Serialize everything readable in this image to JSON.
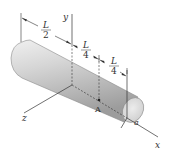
{
  "figure": {
    "type": "3D engineering diagram",
    "axes": {
      "x_label": "x",
      "y_label": "y",
      "z_label": "z"
    },
    "dimensions": [
      {
        "numerator": "L",
        "denominator": "2"
      },
      {
        "numerator": "L",
        "denominator": "4"
      },
      {
        "numerator": "L",
        "denominator": "4"
      }
    ],
    "point_label": "A",
    "radius_label": "a",
    "colors": {
      "cylinder_light": "#e6e6e6",
      "cylinder_dark": "#a9a9a9",
      "cap": "#dcdcdc",
      "lines": "#333333"
    }
  }
}
